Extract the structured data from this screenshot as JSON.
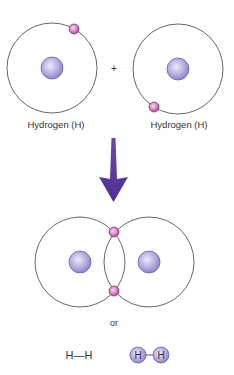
{
  "diagram": {
    "reactants": [
      {
        "label": "Hydrogen (H)",
        "center": [
          52,
          68
        ],
        "orbit_radius": 45,
        "electron": [
          74,
          29
        ]
      },
      {
        "label": "Hydrogen (H)",
        "center": [
          178,
          69
        ],
        "orbit_radius": 45,
        "electron": [
          154,
          107
        ]
      }
    ],
    "plus_sign": "+",
    "arrow": {
      "direction": "down",
      "color": "#5a3a9a"
    },
    "product": {
      "nuclei": [
        [
          80,
          262
        ],
        [
          149,
          262
        ]
      ],
      "orbit_radius": 45,
      "shared_electrons": [
        [
          114,
          232
        ],
        [
          114,
          291
        ]
      ]
    },
    "or_label": "or",
    "structural_formula": "H—H",
    "ball_model": {
      "atoms": [
        "H",
        "H"
      ]
    }
  },
  "colors": {
    "orbit": "#555555",
    "nucleus_light": "#e6e2f6",
    "nucleus_dark": "#8f86c6",
    "nucleus_stroke": "#6a62a6",
    "electron_light": "#f6d2ee",
    "electron_dark": "#b0509a",
    "electron_stroke": "#7a2a6a",
    "arrow": "#5a3a9a",
    "text": "#333333"
  }
}
